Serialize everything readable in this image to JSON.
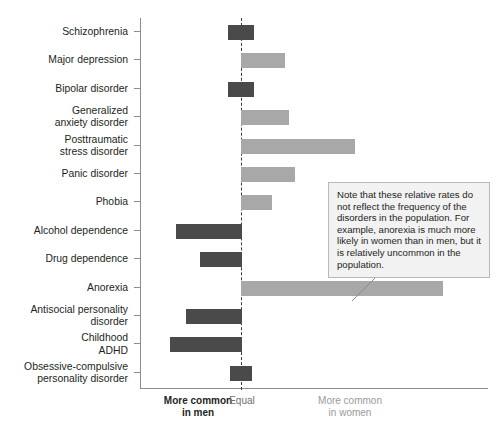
{
  "chart_data": {
    "type": "bar",
    "orientation": "horizontal",
    "title": "",
    "xlabel": "",
    "ylabel": "",
    "categories": [
      "Schizophrenia",
      "Major depression",
      "Bipolar disorder",
      "Generalized anxiety disorder",
      "Posttraumatic stress disorder",
      "Panic disorder",
      "Phobia",
      "Alcohol dependence",
      "Drug dependence",
      "Anorexia",
      "Antisocial personality disorder",
      "Childhood ADHD",
      "Obsessive-compulsive personality disorder"
    ],
    "values": [
      -0.1,
      0.45,
      -0.1,
      0.5,
      1.15,
      0.55,
      0.3,
      -0.65,
      -0.4,
      2.0,
      -0.55,
      -0.7,
      -0.1
    ],
    "value_unit": "relative rate (arbitrary units, negative = more common in men)",
    "series": [
      {
        "name": "More common in men",
        "color": "#4a4a4a",
        "items": [
          {
            "category": "Schizophrenia",
            "value": -0.1
          },
          {
            "category": "Bipolar disorder",
            "value": -0.1
          },
          {
            "category": "Alcohol dependence",
            "value": -0.65
          },
          {
            "category": "Drug dependence",
            "value": -0.4
          },
          {
            "category": "Antisocial personality disorder",
            "value": -0.55
          },
          {
            "category": "Childhood ADHD",
            "value": -0.7
          },
          {
            "category": "Obsessive-compulsive personality disorder",
            "value": -0.1
          }
        ]
      },
      {
        "name": "More common in women",
        "color": "#a8a8a8",
        "items": [
          {
            "category": "Major depression",
            "value": 0.45
          },
          {
            "category": "Generalized anxiety disorder",
            "value": 0.5
          },
          {
            "category": "Posttraumatic stress disorder",
            "value": 1.15
          },
          {
            "category": "Panic disorder",
            "value": 0.55
          },
          {
            "category": "Phobia",
            "value": 0.3
          },
          {
            "category": "Anorexia",
            "value": 2.0
          }
        ]
      }
    ],
    "grid": false,
    "legend_position": "bottom",
    "reference_line": {
      "value": 0,
      "style": "dashed",
      "label": "Equal"
    },
    "annotations": [
      {
        "text": "Note that these relative rates do not reflect the frequency of the disorders in the population. For example, anorexia is much more likely in women than in men, but it is relatively uncommon in the population.",
        "points_to": "Anorexia"
      }
    ]
  },
  "rows": [
    {
      "label_line1": "Schizophrenia",
      "label_line2": "",
      "direction": "men",
      "start": 228,
      "width": 26
    },
    {
      "label_line1": "Major depression",
      "label_line2": "",
      "direction": "women",
      "start": 241,
      "width": 44
    },
    {
      "label_line1": "Bipolar disorder",
      "label_line2": "",
      "direction": "men",
      "start": 228,
      "width": 26
    },
    {
      "label_line1": "Generalized",
      "label_line2": "anxiety disorder",
      "direction": "women",
      "start": 241,
      "width": 48
    },
    {
      "label_line1": "Posttraumatic",
      "label_line2": "stress disorder",
      "direction": "women",
      "start": 241,
      "width": 114
    },
    {
      "label_line1": "Panic disorder",
      "label_line2": "",
      "direction": "women",
      "start": 241,
      "width": 54
    },
    {
      "label_line1": "Phobia",
      "label_line2": "",
      "direction": "women",
      "start": 241,
      "width": 31
    },
    {
      "label_line1": "Alcohol dependence",
      "label_line2": "",
      "direction": "men",
      "start": 176,
      "width": 66
    },
    {
      "label_line1": "Drug dependence",
      "label_line2": "",
      "direction": "men",
      "start": 200,
      "width": 42
    },
    {
      "label_line1": "Anorexia",
      "label_line2": "",
      "direction": "women",
      "start": 241,
      "width": 202
    },
    {
      "label_line1": "Antisocial personality",
      "label_line2": "disorder",
      "direction": "men",
      "start": 186,
      "width": 56
    },
    {
      "label_line1": "Childhood",
      "label_line2": "ADHD",
      "direction": "men",
      "start": 170,
      "width": 72
    },
    {
      "label_line1": "Obsessive-compulsive",
      "label_line2": "personality disorder",
      "direction": "men",
      "start": 230,
      "width": 22
    }
  ],
  "axis_captions": {
    "men_line1": "More common",
    "men_line2": "in men",
    "equal": "Equal",
    "women_line1": "More common",
    "women_line2": "in women"
  },
  "callout": {
    "text": "Note that these relative rates do not reflect the frequency of the disorders in the population. For example, anorexia is much more likely in women than in men, but it is relatively uncommon in the population."
  },
  "colors": {
    "men_bar": "#4a4a4a",
    "women_bar": "#a8a8a8",
    "axis": "#8c8c8c",
    "zero_line": "#3a3a3a",
    "callout_bg": "#f2f2f2",
    "callout_border": "#b9b9b9",
    "text": "#231f20",
    "caption_women": "#9a9a9a",
    "caption_equal": "#6f6f6f"
  }
}
